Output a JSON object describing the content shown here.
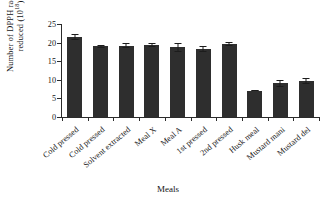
{
  "chart_data": {
    "type": "bar",
    "title": "",
    "xlabel": "Meals",
    "ylabel_text": "Number of DPPH radicals reduced (10",
    "ylabel_exponent": "18",
    "ylabel_tail": ")",
    "ylabel_plain": "Number of DPPH radicals reduced (10^18)",
    "categories": [
      "Cold pressed",
      "Cold pressed",
      "Solvent extracted",
      "Meal X",
      "Meal A",
      "1st pressed",
      "2nd pressed",
      "Husk meal",
      "Mustard mani",
      "Mustard del"
    ],
    "values": [
      21.5,
      19.0,
      19.2,
      19.3,
      18.7,
      18.3,
      19.6,
      7.1,
      9.1,
      9.8
    ],
    "errors": [
      0.8,
      0.4,
      0.7,
      0.5,
      1.3,
      0.9,
      0.6,
      0.2,
      0.9,
      0.8
    ],
    "ylim": [
      0,
      25
    ],
    "ytick_values": [
      25,
      20,
      15,
      10,
      5,
      0
    ],
    "ytick_labels": [
      "25",
      "20",
      "15",
      "10",
      "5",
      "0"
    ],
    "grid": false,
    "legend": false,
    "bar_color": "#2e2e2e",
    "axis_color": "#2b2b2b"
  }
}
